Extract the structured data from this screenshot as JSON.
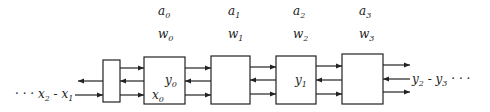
{
  "diagram": {
    "type": "systolic-array",
    "top_labels": [
      {
        "a": "a",
        "a_sub": "0",
        "w": "w",
        "w_sub": "0",
        "x": 165
      },
      {
        "a": "a",
        "a_sub": "1",
        "w": "w",
        "w_sub": "1",
        "x": 235
      },
      {
        "a": "a",
        "a_sub": "2",
        "w": "w",
        "w_sub": "2",
        "x": 300
      },
      {
        "a": "a",
        "a_sub": "3",
        "w": "w",
        "w_sub": "3",
        "x": 366
      }
    ],
    "input_stream": {
      "prefix": "· · · ",
      "v1": "x",
      "s1": "2",
      "sep": " - ",
      "v2": "x",
      "s2": "1"
    },
    "output_stream": {
      "v1": "y",
      "s1": "2",
      "sep": " - ",
      "v2": "y",
      "s2": "3",
      "suffix": " · · ·"
    },
    "cell_labels": {
      "cell0_y": "y",
      "cell0_y_sub": "0",
      "cell0_x": "x",
      "cell0_x_sub": "0",
      "cell2_y": "y",
      "cell2_y_sub": "1"
    }
  }
}
